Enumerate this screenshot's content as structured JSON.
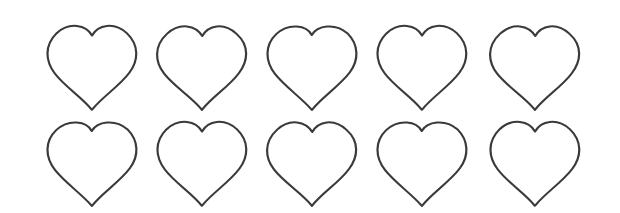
{
  "canvas": {
    "width": 620,
    "height": 213,
    "background_color": "#ffffff",
    "title": "heart-outline-grid"
  },
  "style": {
    "stroke_color": "#3a3a3c",
    "stroke_width": 2.1,
    "fill": "none",
    "shape_name": "heart-outline"
  },
  "grid": {
    "rows": 2,
    "columns": 5,
    "total_shapes": 10,
    "column_pitch": 110,
    "row_pitch": 96,
    "shape_width": 95,
    "shape_height": 88
  },
  "shapes": [
    {
      "id": "heart-r1-c1",
      "row": 1,
      "column": 1,
      "x": 45,
      "y": 22,
      "width": 95,
      "height": 88
    },
    {
      "id": "heart-r1-c2",
      "row": 1,
      "column": 2,
      "x": 155,
      "y": 22,
      "width": 95,
      "height": 88
    },
    {
      "id": "heart-r1-c3",
      "row": 1,
      "column": 3,
      "x": 265,
      "y": 22,
      "width": 95,
      "height": 88
    },
    {
      "id": "heart-r1-c4",
      "row": 1,
      "column": 4,
      "x": 375,
      "y": 22,
      "width": 95,
      "height": 88
    },
    {
      "id": "heart-r1-c5",
      "row": 1,
      "column": 5,
      "x": 488,
      "y": 22,
      "width": 95,
      "height": 88
    },
    {
      "id": "heart-r2-c1",
      "row": 2,
      "column": 1,
      "x": 45,
      "y": 118,
      "width": 95,
      "height": 88
    },
    {
      "id": "heart-r2-c2",
      "row": 2,
      "column": 2,
      "x": 155,
      "y": 118,
      "width": 95,
      "height": 88
    },
    {
      "id": "heart-r2-c3",
      "row": 2,
      "column": 3,
      "x": 265,
      "y": 118,
      "width": 95,
      "height": 88
    },
    {
      "id": "heart-r2-c4",
      "row": 2,
      "column": 4,
      "x": 375,
      "y": 118,
      "width": 95,
      "height": 88
    },
    {
      "id": "heart-r2-c5",
      "row": 2,
      "column": 5,
      "x": 488,
      "y": 118,
      "width": 95,
      "height": 88
    }
  ],
  "path_variants": [
    "M 47.5,17.0 C 35.0,30.5 36.5,47.0 45.5,60.0 C 55.0,74.0 72.0,85.5 81.5,98.5 L 82.0,99.3 L 83.0,98.2 C 93.0,85.0 109.5,73.5 119.0,59.5 C 128.0,46.5 129.0,30.0 116.5,17.0 C 104.0,4.5 88.0,8.0 82.3,19.5 C 76.5,8.0 60.0,4.5 47.5,17.0 Z",
    "M 48.0,17.5 C 34.5,31.0 36.0,48.0 45.0,60.5 C 55.5,75.0 71.5,85.0 81.8,98.8 L 82.2,99.4 L 83.2,98.0 C 93.5,84.5 109.0,74.0 118.5,60.0 C 127.5,47.0 129.5,30.5 116.0,17.5 C 103.5,5.0 88.5,8.5 82.5,20.0 C 76.0,8.5 60.5,5.0 48.0,17.5 Z",
    "M 47.0,18.0 C 35.5,30.0 36.0,47.5 46.0,61.0 C 55.0,73.5 71.0,86.0 81.0,98.0 L 82.1,99.5 L 83.5,97.8 C 92.5,85.5 110.0,73.0 119.5,59.0 C 128.5,46.0 128.5,29.5 117.0,17.0 C 104.5,5.5 87.5,9.0 82.0,19.0 C 77.0,8.5 59.5,5.5 47.0,18.0 Z"
  ]
}
